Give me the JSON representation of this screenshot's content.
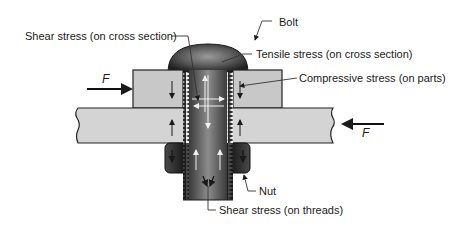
{
  "labels": {
    "bolt": "Bolt",
    "shear_cross_section": "Shear stress (on cross section)",
    "tensile_cross_section": "Tensile stress (on cross section)",
    "compressive_parts": "Compressive stress (on parts)",
    "nut": "Nut",
    "shear_threads": "Shear stress (on threads)",
    "force_left": "F",
    "force_right": "F"
  },
  "colors": {
    "plate_fill": "#c8c8c8",
    "plate_stroke": "#222222",
    "bolt_dark": "#2a2a2a",
    "bolt_mid": "#6e6e6e",
    "leader": "#333333"
  }
}
